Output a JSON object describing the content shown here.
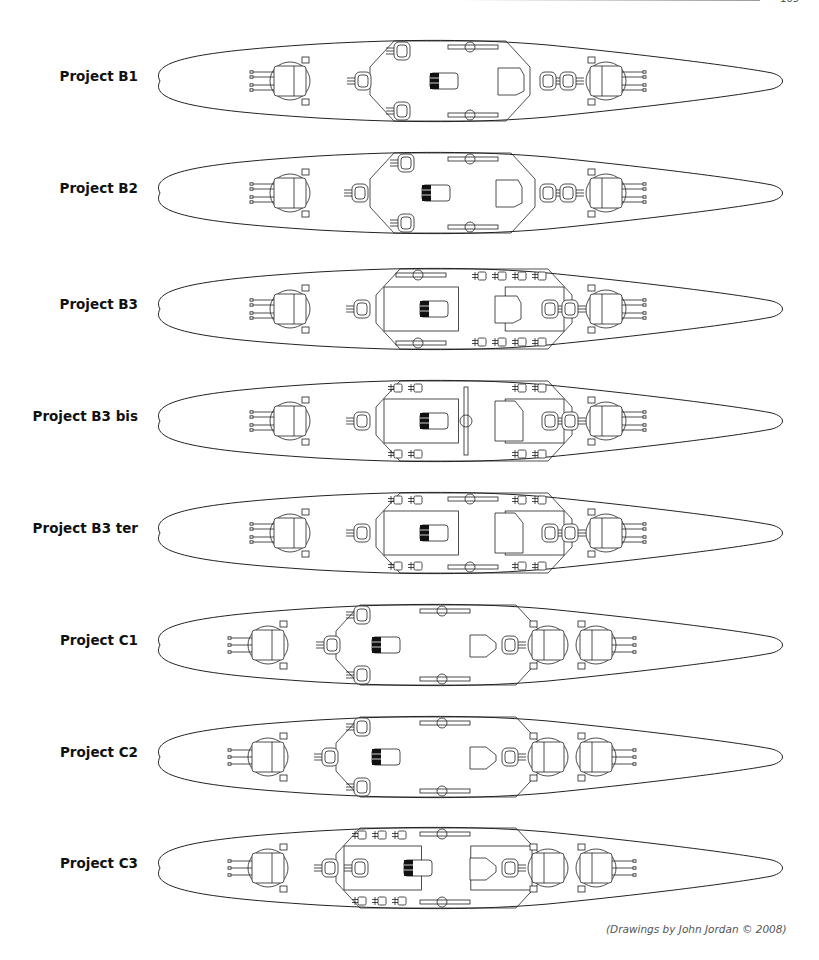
{
  "page": {
    "page_number": "165",
    "caption": "(Drawings by John Jordan © 2008)"
  },
  "ships": [
    {
      "label": "Project B1",
      "row_top": 31,
      "label_y": 46,
      "hull": {
        "stern_x": 8,
        "bow_x": 642,
        "max_half_width": 42
      },
      "fore_turrets": [
        {
          "x": 150,
          "size": "large",
          "guns": 4
        },
        {
          "x": 223,
          "size": "small",
          "guns": 0
        }
      ],
      "wing_turrets": [
        {
          "x": 262,
          "side": "both"
        }
      ],
      "aft_turrets": [
        {
          "x": 408,
          "size": "small"
        },
        {
          "x": 428,
          "size": "small"
        },
        {
          "x": 466,
          "size": "large",
          "guns": 4
        }
      ],
      "superstructure": {
        "fore_x": 230,
        "aft_x": 390,
        "notch": true
      },
      "bridge_x": 290,
      "funnel_x": 358,
      "funnel_shape": "trapezoid",
      "aircraft_rails": {
        "x1": 308,
        "x2": 350,
        "style": "side"
      },
      "secondary_mounts": []
    },
    {
      "label": "Project B2",
      "row_top": 143,
      "label_y": 46,
      "hull": {
        "stern_x": 8,
        "bow_x": 642,
        "max_half_width": 42
      },
      "fore_turrets": [
        {
          "x": 150,
          "size": "large",
          "guns": 4
        },
        {
          "x": 220,
          "size": "small",
          "guns": 0
        }
      ],
      "wing_turrets": [
        {
          "x": 266,
          "side": "both"
        }
      ],
      "aft_turrets": [
        {
          "x": 408,
          "size": "small"
        },
        {
          "x": 428,
          "size": "small"
        },
        {
          "x": 466,
          "size": "large",
          "guns": 4
        }
      ],
      "superstructure": {
        "fore_x": 230,
        "aft_x": 395,
        "notch": true
      },
      "bridge_x": 282,
      "funnel_x": 356,
      "funnel_shape": "trapezoid",
      "aircraft_rails": {
        "x1": 308,
        "x2": 350,
        "style": "side"
      },
      "secondary_mounts": []
    },
    {
      "label": "Project B3",
      "row_top": 259,
      "label_y": 46,
      "hull": {
        "stern_x": 8,
        "bow_x": 642,
        "max_half_width": 42
      },
      "fore_turrets": [
        {
          "x": 150,
          "size": "large",
          "guns": 4
        },
        {
          "x": 222,
          "size": "small",
          "guns": 0
        }
      ],
      "wing_turrets": [],
      "aft_turrets": [
        {
          "x": 410,
          "size": "small"
        },
        {
          "x": 430,
          "size": "small"
        },
        {
          "x": 466,
          "size": "large",
          "guns": 4
        }
      ],
      "superstructure": {
        "fore_x": 236,
        "aft_x": 432,
        "notch": false
      },
      "bridge_x": 280,
      "funnel_x": 355,
      "funnel_shape": "trapezoid",
      "aircraft_rails": {
        "x1": 256,
        "x2": 320,
        "style": "side"
      },
      "secondary_mounts": [
        {
          "x": 338
        },
        {
          "x": 358
        },
        {
          "x": 378
        },
        {
          "x": 398
        }
      ]
    },
    {
      "label": "Project B3 bis",
      "row_top": 371,
      "label_y": 46,
      "hull": {
        "stern_x": 8,
        "bow_x": 642,
        "max_half_width": 42
      },
      "fore_turrets": [
        {
          "x": 150,
          "size": "large",
          "guns": 4
        },
        {
          "x": 222,
          "size": "small",
          "guns": 0
        }
      ],
      "wing_turrets": [],
      "aft_turrets": [
        {
          "x": 410,
          "size": "small"
        },
        {
          "x": 430,
          "size": "small"
        },
        {
          "x": 466,
          "size": "large",
          "guns": 4
        }
      ],
      "superstructure": {
        "fore_x": 236,
        "aft_x": 432,
        "notch": false
      },
      "bridge_x": 280,
      "funnel_x": 355,
      "funnel_shape": "block",
      "aircraft_rails": {
        "x1": 326,
        "x2": 326,
        "style": "center"
      },
      "secondary_mounts": [
        {
          "x": 254
        },
        {
          "x": 274
        },
        {
          "x": 378
        },
        {
          "x": 398
        }
      ]
    },
    {
      "label": "Project B3 ter",
      "row_top": 483,
      "label_y": 46,
      "hull": {
        "stern_x": 8,
        "bow_x": 642,
        "max_half_width": 42
      },
      "fore_turrets": [
        {
          "x": 150,
          "size": "large",
          "guns": 4
        },
        {
          "x": 222,
          "size": "small",
          "guns": 0
        }
      ],
      "wing_turrets": [],
      "aft_turrets": [
        {
          "x": 410,
          "size": "small"
        },
        {
          "x": 430,
          "size": "small"
        },
        {
          "x": 466,
          "size": "large",
          "guns": 4
        }
      ],
      "superstructure": {
        "fore_x": 236,
        "aft_x": 432,
        "notch": false
      },
      "bridge_x": 280,
      "funnel_x": 355,
      "funnel_shape": "block",
      "aircraft_rails": {
        "x1": 308,
        "x2": 350,
        "style": "side"
      },
      "secondary_mounts": [
        {
          "x": 254
        },
        {
          "x": 274
        },
        {
          "x": 378
        },
        {
          "x": 398
        }
      ]
    },
    {
      "label": "Project C1",
      "row_top": 595,
      "label_y": 46,
      "hull": {
        "stern_x": 8,
        "bow_x": 642,
        "max_half_width": 42
      },
      "fore_turrets": [
        {
          "x": 128,
          "size": "large",
          "guns": 3
        },
        {
          "x": 192,
          "size": "small",
          "guns": 0
        }
      ],
      "wing_turrets": [
        {
          "x": 222,
          "side": "both"
        }
      ],
      "aft_turrets": [
        {
          "x": 370,
          "size": "small"
        },
        {
          "x": 408,
          "size": "large",
          "guns": 0
        },
        {
          "x": 456,
          "size": "large",
          "guns": 3
        }
      ],
      "superstructure": {
        "fore_x": 196,
        "aft_x": 400,
        "notch": true
      },
      "bridge_x": 232,
      "funnel_x": 330,
      "funnel_shape": "pentagon",
      "aircraft_rails": {
        "x1": 280,
        "x2": 320,
        "style": "side"
      },
      "secondary_mounts": []
    },
    {
      "label": "Project C2",
      "row_top": 707,
      "label_y": 46,
      "hull": {
        "stern_x": 8,
        "bow_x": 642,
        "max_half_width": 42
      },
      "fore_turrets": [
        {
          "x": 128,
          "size": "large",
          "guns": 3
        },
        {
          "x": 190,
          "size": "small",
          "guns": 0
        }
      ],
      "wing_turrets": [
        {
          "x": 222,
          "side": "both"
        }
      ],
      "aft_turrets": [
        {
          "x": 370,
          "size": "small"
        },
        {
          "x": 408,
          "size": "large",
          "guns": 0
        },
        {
          "x": 456,
          "size": "large",
          "guns": 3
        }
      ],
      "superstructure": {
        "fore_x": 196,
        "aft_x": 400,
        "notch": true
      },
      "bridge_x": 232,
      "funnel_x": 330,
      "funnel_shape": "pentagon",
      "aircraft_rails": {
        "x1": 280,
        "x2": 320,
        "style": "side"
      },
      "secondary_mounts": []
    },
    {
      "label": "Project C3",
      "row_top": 818,
      "label_y": 46,
      "hull": {
        "stern_x": 8,
        "bow_x": 642,
        "max_half_width": 42
      },
      "fore_turrets": [
        {
          "x": 128,
          "size": "large",
          "guns": 3
        },
        {
          "x": 190,
          "size": "small",
          "guns": 0
        },
        {
          "x": 220,
          "size": "small",
          "guns": 0
        }
      ],
      "wing_turrets": [],
      "aft_turrets": [
        {
          "x": 370,
          "size": "small"
        },
        {
          "x": 408,
          "size": "large",
          "guns": 0
        },
        {
          "x": 456,
          "size": "large",
          "guns": 3
        }
      ],
      "superstructure": {
        "fore_x": 196,
        "aft_x": 400,
        "notch": false
      },
      "bridge_x": 264,
      "funnel_x": 330,
      "funnel_shape": "pentagon",
      "aircraft_rails": {
        "x1": 280,
        "x2": 320,
        "style": "side"
      },
      "secondary_mounts": [
        {
          "x": 218
        },
        {
          "x": 238
        },
        {
          "x": 258
        }
      ]
    }
  ]
}
